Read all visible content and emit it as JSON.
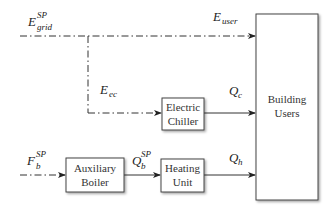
{
  "diagram": {
    "type": "energy-flow block diagram",
    "blocks": {
      "building_users": {
        "line1": "Building",
        "line2": "Users"
      },
      "electric_chiller": {
        "line1": "Electric",
        "line2": "Chiller"
      },
      "auxiliary_boiler": {
        "line1": "Auxiliary",
        "line2": "Boiler"
      },
      "heating_unit": {
        "line1": "Heating",
        "line2": "Unit"
      }
    },
    "labels": {
      "e_grid": {
        "base": "E",
        "sub": "grid",
        "sup": "SP"
      },
      "e_user": {
        "base": "E",
        "sub": "user"
      },
      "e_ec": {
        "base": "E",
        "sub": "ec"
      },
      "q_c": {
        "base": "Q",
        "sub": "c"
      },
      "f_b": {
        "base": "F",
        "sub": "b",
        "sup": "SP"
      },
      "q_b": {
        "base": "Q",
        "sub": "b",
        "sup": "SP"
      },
      "q_h": {
        "base": "Q",
        "sub": "h"
      }
    },
    "edges": [
      {
        "from": "grid",
        "to": "building_users",
        "label": "E_user",
        "style": "dash-dot"
      },
      {
        "from": "grid",
        "to": "electric_chiller",
        "label": "E_ec",
        "style": "dash-dot"
      },
      {
        "from": "electric_chiller",
        "to": "building_users",
        "label": "Q_c",
        "style": "solid"
      },
      {
        "from": "fuel",
        "to": "auxiliary_boiler",
        "label": "F_b^SP",
        "style": "dash-dot"
      },
      {
        "from": "auxiliary_boiler",
        "to": "heating_unit",
        "label": "Q_b^SP",
        "style": "solid"
      },
      {
        "from": "heating_unit",
        "to": "building_users",
        "label": "Q_h",
        "style": "solid"
      }
    ]
  }
}
